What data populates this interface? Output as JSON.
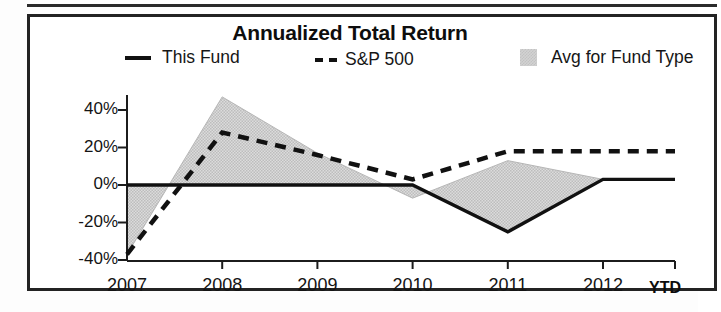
{
  "chart_data": {
    "type": "line",
    "title": "Annualized Total Return",
    "xlabel": "",
    "ylabel": "",
    "grid": false,
    "legend_position": "top",
    "categories": [
      "2007",
      "2008",
      "2009",
      "2010",
      "2011",
      "2012"
    ],
    "x_axis_note": "YTD",
    "ylim": [
      -40,
      50
    ],
    "yticks": [
      40,
      20,
      0,
      -20,
      -40
    ],
    "ytick_labels": [
      "40%",
      "20%",
      "0%",
      "-20%",
      "-40%"
    ],
    "series": [
      {
        "name": "This Fund",
        "style": "solid",
        "color": "#111111",
        "values": [
          0,
          0,
          0,
          0,
          -25,
          3
        ]
      },
      {
        "name": "S&P 500",
        "style": "dashed",
        "color": "#111111",
        "values": [
          -37,
          28,
          16,
          3,
          18,
          18
        ]
      },
      {
        "name": "Avg for Fund Type",
        "style": "filled-area",
        "color": "#d2d2d2",
        "values": [
          -37,
          47,
          17,
          -7,
          13,
          3
        ]
      }
    ]
  },
  "chart": {
    "title": "Annualized Total Return",
    "ytd_note": "YTD",
    "legend": [
      {
        "label": "This Fund",
        "marker": "solid-line-swatch"
      },
      {
        "label": "S&P 500",
        "marker": "dashed-line-swatch"
      },
      {
        "label": "Avg for Fund Type",
        "marker": "gray-fill-swatch"
      }
    ],
    "y_ticks": [
      "40%",
      "20%",
      "0%",
      "-20%",
      "-40%"
    ],
    "x_ticks": [
      "2007",
      "2008",
      "2009",
      "2010",
      "2011",
      "2012"
    ],
    "colors": {
      "line": "#111111",
      "area_fill": "#d2d2d2",
      "axis": "#1a1a1a",
      "border": "#232323"
    }
  }
}
